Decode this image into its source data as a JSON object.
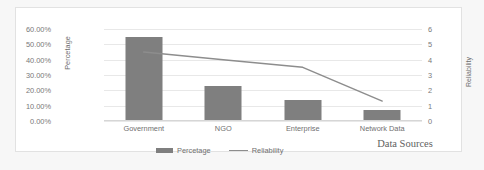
{
  "chart_data": {
    "type": "bar",
    "title": "",
    "subtitle": "",
    "xlabel": "Data Sources",
    "categories": [
      "Government",
      "NGO",
      "Enterprise",
      "Network Data"
    ],
    "grid": true,
    "legend_position": "bottom",
    "series": [
      {
        "name": "Percetage",
        "type": "bar",
        "axis": "left",
        "color": "#7f7f7f",
        "values": [
          0.55,
          0.23,
          0.14,
          0.07
        ]
      },
      {
        "name": "Reliability",
        "type": "line",
        "axis": "right",
        "color": "#8d8d8d",
        "values": [
          4.5,
          4.0,
          3.5,
          1.3
        ]
      }
    ],
    "axes": {
      "left": {
        "label": "Percetage",
        "min": 0,
        "max": 0.6,
        "ticks": [
          0,
          0.1,
          0.2,
          0.3,
          0.4,
          0.5,
          0.6
        ],
        "tick_labels": [
          "0.00%",
          "10.00%",
          "20.00%",
          "30.00%",
          "40.00%",
          "50.00%",
          "60.00%"
        ]
      },
      "right": {
        "label": "Reliability",
        "min": 0,
        "max": 6,
        "ticks": [
          0,
          1,
          2,
          3,
          4,
          5,
          6
        ],
        "tick_labels": [
          "0",
          "1",
          "2",
          "3",
          "4",
          "5",
          "6"
        ]
      }
    }
  },
  "legend": {
    "entries": [
      {
        "label": "Percetage"
      },
      {
        "label": "Reliability"
      }
    ]
  }
}
